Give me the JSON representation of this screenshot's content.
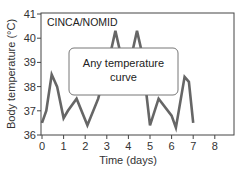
{
  "chart_data": {
    "type": "line",
    "title": "CINCA/NOMID",
    "xlabel": "Time (days)",
    "ylabel": "Body temperature (°C)",
    "xlim": [
      0,
      8.9
    ],
    "ylim": [
      36,
      41
    ],
    "xticks": [
      0,
      1,
      2,
      3,
      4,
      5,
      6,
      7,
      8
    ],
    "yticks": [
      36,
      37,
      38,
      39,
      40,
      41
    ],
    "grid": false,
    "legend": null,
    "annotations": [
      {
        "text_lines": [
          "Any temperature",
          "curve"
        ],
        "type": "rounded-box-overlay",
        "x_range": [
          1.25,
          6.3
        ],
        "y_range": [
          37.8,
          39.7
        ]
      }
    ],
    "series": [
      {
        "name": "Body temperature",
        "color": "#666666",
        "x": [
          0,
          0.2,
          0.45,
          0.7,
          1.0,
          1.2,
          1.6,
          2.1,
          2.6,
          3.2,
          3.4,
          3.6,
          4.2,
          4.4,
          4.6,
          5.0,
          5.4,
          6.0,
          6.2,
          6.6,
          6.8,
          7.0
        ],
        "y": [
          36.5,
          37.0,
          38.5,
          38.0,
          36.7,
          37.0,
          37.5,
          36.4,
          37.5,
          39.5,
          40.3,
          39.5,
          39.5,
          40.3,
          39.5,
          36.4,
          37.5,
          36.8,
          36.3,
          38.4,
          38.2,
          36.5
        ]
      }
    ]
  }
}
